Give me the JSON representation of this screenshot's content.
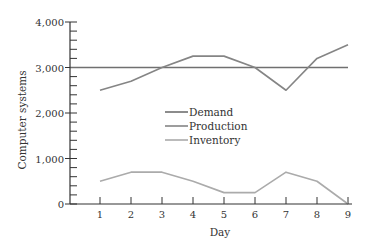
{
  "chart_data": {
    "type": "line",
    "title": "",
    "xlabel": "Day",
    "ylabel": "Computer systems",
    "x": [
      1,
      2,
      3,
      4,
      5,
      6,
      7,
      8,
      9
    ],
    "xlim": [
      0,
      9
    ],
    "ylim": [
      0,
      4000
    ],
    "yticks_major": [
      0,
      1000,
      2000,
      3000,
      4000
    ],
    "ytick_labels": [
      "0",
      "1,000",
      "2,000",
      "3,000",
      "4,000"
    ],
    "yticks_minor_step": 200,
    "xtick_labels": [
      "1",
      "2",
      "3",
      "4",
      "5",
      "6",
      "7",
      "8",
      "9"
    ],
    "grid": false,
    "legend_position": "center",
    "series": [
      {
        "name": "Demand",
        "color": "#707070",
        "values": [
          3000,
          3000,
          3000,
          3000,
          3000,
          3000,
          3000,
          3000,
          3000
        ],
        "extends_from_axis": true
      },
      {
        "name": "Production",
        "color": "#858585",
        "values": [
          2500,
          2700,
          3000,
          3250,
          3250,
          3000,
          2500,
          3200,
          3500
        ]
      },
      {
        "name": "Inventory",
        "color": "#ababab",
        "values": [
          500,
          700,
          700,
          500,
          250,
          250,
          700,
          500,
          0
        ]
      }
    ]
  },
  "legend": {
    "items": [
      {
        "label": "Demand"
      },
      {
        "label": "Production"
      },
      {
        "label": "Inventory"
      }
    ]
  }
}
